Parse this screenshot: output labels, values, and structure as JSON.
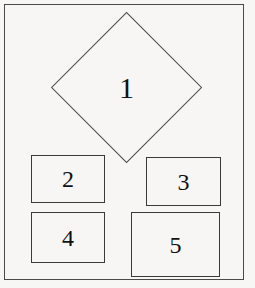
{
  "figure": {
    "background_color": "#f7f6f4",
    "line_color": "#4a4a4a",
    "text_color": "#111111",
    "frame": {
      "label": "outer-frame"
    }
  },
  "nodes": [
    {
      "id": "node-1",
      "label": "1",
      "shape": "diamond",
      "x": 50,
      "y": 13,
      "width": 153,
      "height": 150
    },
    {
      "id": "node-2",
      "label": "2",
      "shape": "rectangle",
      "x": 31,
      "y": 155,
      "width": 74,
      "height": 48
    },
    {
      "id": "node-3",
      "label": "3",
      "shape": "rectangle",
      "x": 146,
      "y": 157,
      "width": 75,
      "height": 49
    },
    {
      "id": "node-4",
      "label": "4",
      "shape": "rectangle",
      "x": 31,
      "y": 212,
      "width": 74,
      "height": 51
    },
    {
      "id": "node-5",
      "label": "5",
      "shape": "rectangle",
      "x": 131,
      "y": 212,
      "width": 89,
      "height": 65
    }
  ]
}
